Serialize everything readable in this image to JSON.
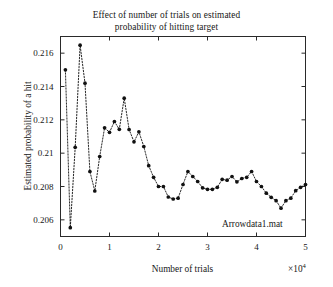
{
  "chart_data": {
    "type": "line",
    "title": "Effect of number of trials on estimated probability of hitting target",
    "title_line1": "Effect of number of trials on estimated",
    "title_line2": "probability of hitting target",
    "xlabel": "Number of trials",
    "ylabel": "Estimated probability of a hit",
    "x_exponent_label": "×10",
    "x_exponent_power": "4",
    "x_scale_factor": 10000,
    "annotation": "Arrowdata1.mat",
    "grid": false,
    "legend": "none",
    "marker": "filled-circle",
    "linestyle": "dotted",
    "series_color": "#111111",
    "xlim": [
      0,
      50000
    ],
    "ylim": [
      0.205,
      0.217
    ],
    "xticks": [
      0,
      1,
      2,
      3,
      4,
      5
    ],
    "xtick_labels": [
      "0",
      "1",
      "2",
      "3",
      "4",
      "5"
    ],
    "yticks": [
      0.206,
      0.208,
      0.21,
      0.212,
      0.214,
      0.216
    ],
    "ytick_labels": [
      "0.206",
      "0.208",
      "0.21",
      "0.212",
      "0.214",
      "0.216"
    ],
    "x": [
      1000,
      2000,
      3000,
      4000,
      5000,
      6000,
      7000,
      8000,
      9000,
      10000,
      11000,
      12000,
      13000,
      14000,
      15000,
      16000,
      17000,
      18000,
      19000,
      20000,
      21000,
      22000,
      23000,
      24000,
      25000,
      26000,
      27000,
      28000,
      29000,
      30000,
      31000,
      32000,
      33000,
      34000,
      35000,
      36000,
      37000,
      38000,
      39000,
      40000,
      41000,
      42000,
      43000,
      44000,
      45000,
      46000,
      47000,
      48000,
      49000,
      50000
    ],
    "values": [
      0.215,
      0.20553,
      0.21035,
      0.21648,
      0.2142,
      0.2089,
      0.20773,
      0.2098,
      0.21152,
      0.21125,
      0.2119,
      0.21143,
      0.2133,
      0.21142,
      0.21068,
      0.21128,
      0.2104,
      0.20925,
      0.20855,
      0.208,
      0.208,
      0.20737,
      0.20725,
      0.2073,
      0.20812,
      0.2089,
      0.2086,
      0.2083,
      0.20792,
      0.20783,
      0.20783,
      0.20795,
      0.20843,
      0.20838,
      0.2086,
      0.20828,
      0.20848,
      0.20855,
      0.2089,
      0.2083,
      0.208,
      0.2076,
      0.20735,
      0.20715,
      0.2067,
      0.20715,
      0.2073,
      0.20775,
      0.20795,
      0.20812
    ],
    "series": [
      {
        "name": "Arrowdata1.mat",
        "values": [
          0.215,
          0.20553,
          0.21035,
          0.21648,
          0.2142,
          0.2089,
          0.20773,
          0.2098,
          0.21152,
          0.21125,
          0.2119,
          0.21143,
          0.2133,
          0.21142,
          0.21068,
          0.21128,
          0.2104,
          0.20925,
          0.20855,
          0.208,
          0.208,
          0.20737,
          0.20725,
          0.2073,
          0.20812,
          0.2089,
          0.2086,
          0.2083,
          0.20792,
          0.20783,
          0.20783,
          0.20795,
          0.20843,
          0.20838,
          0.2086,
          0.20828,
          0.20848,
          0.20855,
          0.2089,
          0.2083,
          0.208,
          0.2076,
          0.20735,
          0.20715,
          0.2067,
          0.20715,
          0.2073,
          0.20775,
          0.20795,
          0.20812
        ]
      }
    ]
  }
}
